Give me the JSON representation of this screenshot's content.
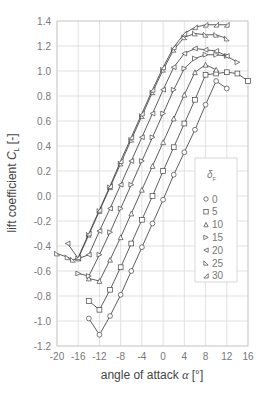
{
  "chart_data": {
    "type": "line",
    "title": "",
    "xlabel": "angle of attack α [°]",
    "xlabel_parts": {
      "text": "angle of attack ",
      "symbol": "α",
      "unit": " [°]"
    },
    "ylabel": "lift coefficient C_L [-]",
    "ylabel_parts": {
      "text": "lift coefficient ",
      "symbol": "C",
      "sub": "L",
      "unit": " [-]"
    },
    "xlim": [
      -20,
      16
    ],
    "ylim": [
      -1.2,
      1.4
    ],
    "xticks": [
      "-20",
      "-16",
      "-12",
      "-8",
      "-4",
      "0",
      "4",
      "8",
      "12",
      "16"
    ],
    "xtick_values": [
      -20,
      -16,
      -12,
      -8,
      -4,
      0,
      4,
      8,
      12,
      16
    ],
    "yticks": [
      "1.4",
      "1.2",
      "1.0",
      "0.8",
      "0.6",
      "0.4",
      "0.2",
      "0.0",
      "-0.2",
      "-0.4",
      "-0.6",
      "-0.8",
      "-1.0",
      "-1.2"
    ],
    "ytick_values": [
      1.4,
      1.2,
      1.0,
      0.8,
      0.6,
      0.4,
      0.2,
      0.0,
      -0.2,
      -0.4,
      -0.6,
      -0.8,
      -1.0,
      -1.2
    ],
    "grid": true,
    "legend": {
      "title": "δ",
      "title_sub": "F",
      "position": "right-middle",
      "entries": [
        "0",
        "5",
        "10",
        "15",
        "20",
        "25",
        "30"
      ]
    },
    "series": [
      {
        "name": "0",
        "marker": "circle",
        "x": [
          -14,
          -12,
          -10,
          -8,
          -6,
          -4,
          -2,
          0,
          2,
          4,
          6,
          8,
          10,
          12
        ],
        "y": [
          -0.98,
          -1.11,
          -0.96,
          -0.79,
          -0.6,
          -0.41,
          -0.22,
          -0.03,
          0.17,
          0.35,
          0.53,
          0.73,
          0.92,
          0.86
        ]
      },
      {
        "name": "5",
        "marker": "square",
        "x": [
          -14,
          -12,
          -10,
          -8,
          -6,
          -4,
          -2,
          0,
          2,
          4,
          6,
          8,
          10,
          12,
          14,
          16
        ],
        "y": [
          -0.84,
          -0.91,
          -0.75,
          -0.57,
          -0.38,
          -0.19,
          0.0,
          0.2,
          0.39,
          0.58,
          0.77,
          0.97,
          0.98,
          0.99,
          0.98,
          0.92
        ]
      },
      {
        "name": "10",
        "marker": "triangle-up",
        "x": [
          -14,
          -12,
          -10,
          -8,
          -6,
          -4,
          -2,
          0,
          2,
          4,
          6,
          8,
          10
        ],
        "y": [
          -0.66,
          -0.68,
          -0.51,
          -0.33,
          -0.14,
          0.05,
          0.24,
          0.43,
          0.62,
          0.81,
          0.99,
          1.05,
          1.01
        ]
      },
      {
        "name": "15",
        "marker": "triangle-right",
        "x": [
          -16,
          -14,
          -12,
          -10,
          -8,
          -6,
          -4,
          -2,
          0,
          2,
          4,
          6,
          8,
          10,
          12,
          14
        ],
        "y": [
          -0.62,
          -0.64,
          -0.47,
          -0.29,
          -0.1,
          0.09,
          0.28,
          0.47,
          0.66,
          0.85,
          1.02,
          1.1,
          1.13,
          1.13,
          1.12,
          1.07
        ]
      },
      {
        "name": "20",
        "marker": "triangle-left",
        "x": [
          -18,
          -16,
          -14,
          -12,
          -10,
          -8,
          -6,
          -4,
          -2,
          0,
          2,
          4,
          6,
          8,
          10,
          12
        ],
        "y": [
          -0.38,
          -0.5,
          -0.47,
          -0.28,
          -0.1,
          0.09,
          0.28,
          0.47,
          0.66,
          0.85,
          1.03,
          1.14,
          1.18,
          1.17,
          1.16,
          1.12
        ]
      },
      {
        "name": "25",
        "marker": "triangle-br",
        "x": [
          -20,
          -18,
          -17,
          -16,
          -14,
          -12,
          -10,
          -8,
          -6,
          -4,
          -2,
          0,
          2,
          4,
          6,
          8,
          10,
          12
        ],
        "y": [
          -0.46,
          -0.49,
          -0.51,
          -0.5,
          -0.31,
          -0.12,
          0.07,
          0.26,
          0.45,
          0.64,
          0.83,
          1.01,
          1.17,
          1.27,
          1.3,
          1.29,
          1.29,
          1.26
        ]
      },
      {
        "name": "30",
        "marker": "triangle-bl",
        "x": [
          -16,
          -14,
          -12,
          -10,
          -8,
          -6,
          -4,
          -2,
          0,
          2,
          4,
          6,
          8,
          10,
          12
        ],
        "y": [
          -0.49,
          -0.3,
          -0.11,
          0.08,
          0.28,
          0.47,
          0.66,
          0.85,
          1.03,
          1.19,
          1.3,
          1.35,
          1.37,
          1.37,
          1.37
        ]
      }
    ]
  },
  "plot_area": {
    "left": 57,
    "top": 21,
    "right": 248,
    "bottom": 346
  },
  "legend_box": {
    "left": 195,
    "top": 158,
    "width": 42,
    "height": 124
  },
  "colors": {
    "line": "#333333",
    "marker": "#444444",
    "grid": "#d9d9d9",
    "tick_text": "#777777",
    "label_text": "#444444",
    "frame": "#c8c8c8"
  }
}
